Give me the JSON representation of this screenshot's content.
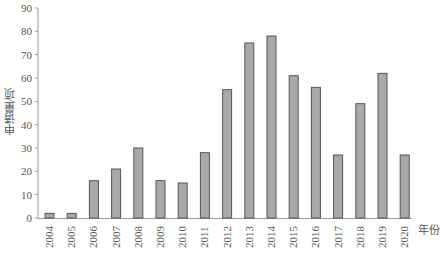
{
  "chart_data": {
    "type": "bar",
    "title": "",
    "xlabel": "年份",
    "ylabel": "申请量/项",
    "ylim": [
      0,
      90
    ],
    "yticks": [
      0,
      10,
      20,
      30,
      40,
      50,
      60,
      70,
      80,
      90
    ],
    "grid": false,
    "legend": null,
    "categories": [
      "2004",
      "2005",
      "2006",
      "2007",
      "2008",
      "2009",
      "2010",
      "2011",
      "2012",
      "2013",
      "2014",
      "2015",
      "2016",
      "2017",
      "2018",
      "2019",
      "2020"
    ],
    "values": [
      2,
      2,
      16,
      21,
      30,
      16,
      15,
      28,
      55,
      75,
      78,
      61,
      56,
      27,
      49,
      62,
      27
    ],
    "colors": {
      "bar_fill": "#a9a9a9",
      "bar_stroke": "#555555",
      "axis": "#9a9a9a",
      "text": "#555555"
    }
  }
}
